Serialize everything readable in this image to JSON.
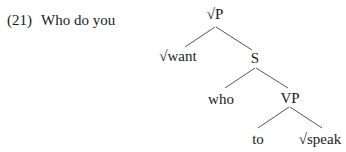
{
  "example": {
    "number": "(21)",
    "sentence": "Who do you"
  },
  "tree": {
    "root": "√P",
    "nodes": {
      "root": "√P",
      "want": "√want",
      "S": "S",
      "who": "who",
      "VP": "VP",
      "to": "to",
      "speak": "√speak"
    },
    "edges": [
      [
        "√P",
        "√want"
      ],
      [
        "√P",
        "S"
      ],
      [
        "S",
        "who"
      ],
      [
        "S",
        "VP"
      ],
      [
        "VP",
        "to"
      ],
      [
        "VP",
        "√speak"
      ]
    ]
  }
}
